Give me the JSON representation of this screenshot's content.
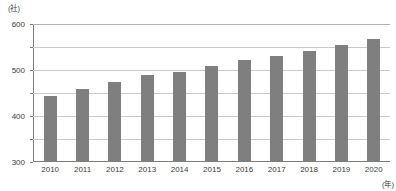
{
  "chart_data": {
    "type": "bar",
    "title": "",
    "subtitle": "",
    "xlabel": "(年)",
    "ylabel": "(社)",
    "categories": [
      "2010",
      "2011",
      "2012",
      "2013",
      "2014",
      "2015",
      "2016",
      "2017",
      "2018",
      "2019",
      "2020"
    ],
    "values": [
      283,
      317,
      348,
      378,
      388,
      418,
      443,
      460,
      480,
      510,
      535
    ],
    "series": [
      {
        "name": "社数",
        "values": [
          283,
          317,
          348,
          378,
          388,
          418,
          443,
          460,
          480,
          510,
          535
        ]
      }
    ],
    "ylim": [
      0,
      600
    ],
    "ytick_labels": [
      "600",
      "500",
      "400",
      "300",
      "200",
      "100",
      "0"
    ],
    "ytick_values": [
      600,
      500,
      400,
      300,
      200,
      100,
      0
    ],
    "grid": true,
    "legend": "none",
    "bar_color": "#7f7f7f",
    "grid_color": "#c9c9c9",
    "axis_color": "#7d7d7d",
    "text_color": "#3b3b3b"
  },
  "axes": {
    "y_unit_label": "(社)",
    "x_unit_label": "(年)"
  }
}
